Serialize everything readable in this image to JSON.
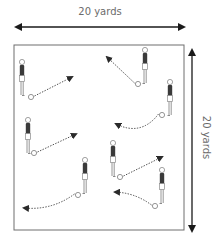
{
  "diagram": {
    "width_label": "20 yards",
    "height_label": "20 yards",
    "colors": {
      "line": "#1a1a1a",
      "field_border": "#6e6e6e",
      "label": "#6b6b6b",
      "player_shirt": "#3a3a3a",
      "player_outline": "#8a8a8a",
      "pass_arrow": "#3a3a3a"
    },
    "field": {
      "x": 14,
      "y": 45,
      "width": 170,
      "height": 185
    },
    "width_arrow": {
      "x1": 14,
      "x2": 186,
      "y": 27
    },
    "height_arrow": {
      "x": 192,
      "y1": 48,
      "y2": 233
    },
    "players": [
      {
        "id": "A",
        "head": [
          22,
          62
        ],
        "facing": "right",
        "ball": [
          31,
          97
        ],
        "pass_to": [
          72,
          77
        ],
        "curve": 0
      },
      {
        "id": "B",
        "head": [
          145,
          50
        ],
        "facing": "left",
        "ball": [
          138,
          84
        ],
        "pass_to": [
          107,
          57
        ],
        "curve": 0
      },
      {
        "id": "C",
        "head": [
          170,
          82
        ],
        "facing": "left",
        "ball": [
          162,
          115
        ],
        "pass_to": [
          116,
          124
        ],
        "curve": -18
      },
      {
        "id": "D",
        "head": [
          28,
          120
        ],
        "facing": "right",
        "ball": [
          34,
          153
        ],
        "pass_to": [
          76,
          134
        ],
        "curve": 0
      },
      {
        "id": "E",
        "head": [
          113,
          143
        ],
        "facing": "right",
        "ball": [
          120,
          177
        ],
        "pass_to": [
          162,
          157
        ],
        "curve": 0
      },
      {
        "id": "F",
        "head": [
          85,
          160
        ],
        "facing": "left",
        "ball": [
          78,
          195
        ],
        "pass_to": [
          24,
          208
        ],
        "curve": -10
      },
      {
        "id": "G",
        "head": [
          162,
          170
        ],
        "facing": "left",
        "ball": [
          155,
          206
        ],
        "pass_to": [
          115,
          192
        ],
        "curve": 6
      }
    ]
  }
}
